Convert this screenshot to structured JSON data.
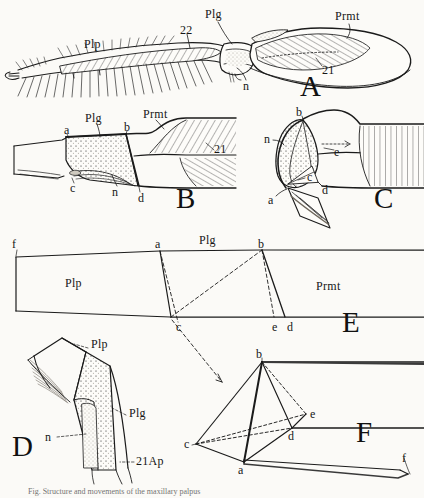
{
  "plate": {
    "title": "Comparative plate of insect appendage segments (Plp, Plg, Prmt)",
    "background_color": "#fbfaf7",
    "ink_color": "#1a1a1a",
    "stipple_color": "#9a9489"
  },
  "panels": [
    {
      "id": "A",
      "letter": "A",
      "x": 300,
      "y": 78
    },
    {
      "id": "B",
      "letter": "B",
      "x": 176,
      "y": 186
    },
    {
      "id": "C",
      "letter": "C",
      "x": 374,
      "y": 186
    },
    {
      "id": "E",
      "letter": "E",
      "x": 342,
      "y": 312
    },
    {
      "id": "D",
      "letter": "D",
      "x": 14,
      "y": 438
    },
    {
      "id": "F",
      "letter": "F",
      "x": 358,
      "y": 424
    }
  ],
  "labels": {
    "figA": [
      {
        "text": "Plp",
        "x": 84,
        "y": 38
      },
      {
        "text": "22",
        "x": 180,
        "y": 28
      },
      {
        "text": "Plg",
        "x": 208,
        "y": 12
      },
      {
        "text": "Prmt",
        "x": 340,
        "y": 14
      },
      {
        "text": "21",
        "x": 325,
        "y": 68
      },
      {
        "text": "n",
        "x": 243,
        "y": 84
      }
    ],
    "figB": [
      {
        "text": "Plg",
        "x": 88,
        "y": 116
      },
      {
        "text": "Prmt",
        "x": 145,
        "y": 112
      },
      {
        "text": "a",
        "x": 66,
        "y": 132
      },
      {
        "text": "b",
        "x": 126,
        "y": 128
      },
      {
        "text": "21",
        "x": 216,
        "y": 150
      },
      {
        "text": "c",
        "x": 72,
        "y": 186
      },
      {
        "text": "n",
        "x": 113,
        "y": 190
      },
      {
        "text": "d",
        "x": 140,
        "y": 198
      }
    ],
    "figC": [
      {
        "text": "b",
        "x": 296,
        "y": 113
      },
      {
        "text": "n",
        "x": 266,
        "y": 139
      },
      {
        "text": "e",
        "x": 335,
        "y": 152
      },
      {
        "text": "c",
        "x": 307,
        "y": 177
      },
      {
        "text": "d",
        "x": 323,
        "y": 189
      },
      {
        "text": "a",
        "x": 270,
        "y": 199
      }
    ],
    "figE": [
      {
        "text": "f",
        "x": 14,
        "y": 244
      },
      {
        "text": "a",
        "x": 155,
        "y": 245
      },
      {
        "text": "Plg",
        "x": 205,
        "y": 240
      },
      {
        "text": "b",
        "x": 258,
        "y": 245
      },
      {
        "text": "Plp",
        "x": 68,
        "y": 278
      },
      {
        "text": "Prmt",
        "x": 320,
        "y": 282
      },
      {
        "text": "c",
        "x": 178,
        "y": 327
      },
      {
        "text": "e",
        "x": 275,
        "y": 327
      },
      {
        "text": "d",
        "x": 290,
        "y": 327
      }
    ],
    "figD": [
      {
        "text": "Plp",
        "x": 91,
        "y": 346
      },
      {
        "text": "Plg",
        "x": 129,
        "y": 414
      },
      {
        "text": "n",
        "x": 48,
        "y": 436
      },
      {
        "text": "21Ap",
        "x": 136,
        "y": 462
      }
    ],
    "figF": [
      {
        "text": "b",
        "x": 257,
        "y": 355
      },
      {
        "text": "e",
        "x": 304,
        "y": 417
      },
      {
        "text": "d",
        "x": 290,
        "y": 436
      },
      {
        "text": "c",
        "x": 191,
        "y": 448
      },
      {
        "text": "a",
        "x": 238,
        "y": 470
      },
      {
        "text": "f",
        "x": 400,
        "y": 464
      }
    ]
  },
  "caption": {
    "text": "Fig.  Structure and movements of the maxillary palpus"
  },
  "terms": {
    "Plp": "palpus segment",
    "Plg": "palpiger",
    "Prmt": "prementum",
    "n": "nerve",
    "21": "muscle 21",
    "22": "muscle 22",
    "21Ap": "apodeme of muscle 21"
  }
}
